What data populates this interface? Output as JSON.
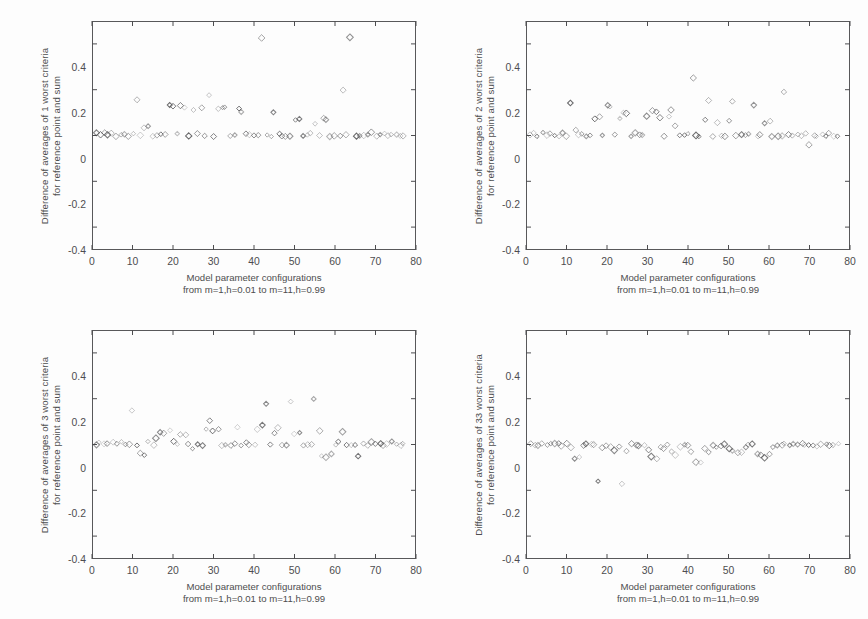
{
  "figure": {
    "panel_count": 4,
    "background_color": "#fdfdfd",
    "ink_color": "#4d4d4f",
    "marker_symbol": "open-diamond"
  },
  "axis": {
    "x_ticks": [
      "0",
      "10",
      "20",
      "30",
      "40",
      "50",
      "60",
      "70",
      "80"
    ],
    "y_ticks": [
      "0.4",
      "0.2",
      "0",
      "-0.2",
      "-0.4"
    ],
    "xlabel_line1": "Model parameter configurations",
    "xlabel_line2": "from m=1,h=0.01 to m=11,h=0.99",
    "xlabel": "Model parameter configurations\nfrom m=1,h=0.01 to m=11,h=0.99"
  },
  "panels": [
    {
      "id": "panel-1-worst",
      "ylabel_line1": "Difference of averages of 1 worst criteria",
      "ylabel_line2": "for reference point and sum",
      "ylabel": "Difference of averages of 1 worst criteria\nfor reference point and sum"
    },
    {
      "id": "panel-2-worst",
      "ylabel_line1": "Difference of averages of 2 worst criteria",
      "ylabel_line2": "for reference point and sum",
      "ylabel": "Difference of averages of 2 worst criteria\nfor reference point and sum"
    },
    {
      "id": "panel-3-worst",
      "ylabel_line1": "Difference of averages of 3 worst criteria",
      "ylabel_line2": "for reference point and sum",
      "ylabel": "Difference of averages of 3 worst criteria\nfor reference point and sum"
    },
    {
      "id": "panel-33-worst",
      "ylabel_line1": "Difference of averages of 33 worst criteria",
      "ylabel_line2": "for reference point and sum",
      "ylabel": "Difference of averages of 33 worst criteria\nfor reference point and sum"
    }
  ],
  "chart_data": [
    {
      "type": "scatter",
      "title": "",
      "xlabel": "Model parameter configurations from m=1,h=0.01 to m=11,h=0.99",
      "ylabel": "Difference of averages of 1 worst criteria for reference point and sum",
      "xlim": [
        0,
        80
      ],
      "ylim": [
        -0.5,
        0.5
      ],
      "xticks": [
        0,
        10,
        20,
        30,
        40,
        50,
        60,
        70,
        80
      ],
      "yticks": [
        -0.4,
        -0.2,
        0,
        0.2,
        0.4
      ],
      "grid": false,
      "legend": "none",
      "marker": "open-diamond",
      "series": [
        {
          "name": "1 worst criteria",
          "x": [
            1,
            2,
            3,
            4,
            5,
            6,
            7,
            8,
            9,
            10,
            11,
            12,
            13,
            14,
            15,
            16,
            17,
            18,
            19,
            20,
            21,
            22,
            23,
            24,
            25,
            26,
            27,
            28,
            29,
            30,
            31,
            32,
            33,
            34,
            35,
            36,
            37,
            38,
            39,
            40,
            41,
            42,
            43,
            44,
            45,
            46,
            47,
            48,
            49,
            50,
            51,
            52,
            53,
            54,
            55,
            56,
            57,
            58,
            59,
            60,
            61,
            62,
            63,
            64,
            65,
            66,
            67,
            68,
            69,
            70,
            71,
            72,
            73,
            74,
            75,
            76,
            77
          ],
          "y": [
            0.01,
            0.0,
            0.01,
            0.0,
            0.01,
            0.0,
            0.0,
            0.01,
            0.0,
            0.01,
            0.155,
            0.0,
            0.03,
            0.04,
            0.0,
            0.0,
            0.01,
            0.0,
            0.135,
            0.125,
            0.01,
            0.13,
            0.125,
            0.0,
            0.115,
            0.01,
            0.125,
            0.0,
            0.175,
            0.0,
            0.115,
            0.12,
            0.12,
            0.0,
            0.0,
            0.115,
            0.105,
            0.01,
            0.0,
            0.0,
            0.0,
            0.43,
            0.0,
            0.0,
            0.105,
            0.01,
            0.0,
            0.0,
            0.0,
            0.065,
            0.07,
            0.0,
            0.0,
            0.01,
            0.055,
            0.0,
            0.075,
            0.07,
            0.0,
            0.0,
            0.0,
            0.2,
            0.0,
            0.425,
            0.0,
            0.0,
            0.0,
            0.0,
            0.01,
            0.0,
            0.0,
            0.01,
            0.0,
            0.0,
            0.0,
            0.0,
            0.0
          ]
        }
      ]
    },
    {
      "type": "scatter",
      "title": "",
      "xlabel": "Model parameter configurations from m=1,h=0.01 to m=11,h=0.99",
      "ylabel": "Difference of averages of 2 worst criteria for reference point and sum",
      "xlim": [
        0,
        80
      ],
      "ylim": [
        -0.5,
        0.5
      ],
      "xticks": [
        0,
        10,
        20,
        30,
        40,
        50,
        60,
        70,
        80
      ],
      "yticks": [
        -0.4,
        -0.2,
        0,
        0.2,
        0.4
      ],
      "grid": false,
      "legend": "none",
      "marker": "open-diamond",
      "series": [
        {
          "name": "2 worst criteria",
          "x": [
            1,
            2,
            3,
            4,
            5,
            6,
            7,
            8,
            9,
            10,
            11,
            12,
            13,
            14,
            15,
            16,
            17,
            18,
            19,
            20,
            21,
            22,
            23,
            24,
            25,
            26,
            27,
            28,
            29,
            30,
            31,
            32,
            33,
            34,
            35,
            36,
            37,
            38,
            39,
            40,
            41,
            42,
            43,
            44,
            45,
            46,
            47,
            48,
            49,
            50,
            51,
            52,
            53,
            54,
            55,
            56,
            57,
            58,
            59,
            60,
            61,
            62,
            63,
            64,
            65,
            66,
            67,
            68,
            69,
            70,
            71,
            72,
            73,
            74,
            75,
            76,
            77
          ],
          "y": [
            0.0,
            0.01,
            0.0,
            0.01,
            0.0,
            0.01,
            0.0,
            0.0,
            0.01,
            0.0,
            0.145,
            0.02,
            0.0,
            0.01,
            0.0,
            0.0,
            0.075,
            0.08,
            0.0,
            0.135,
            0.13,
            0.0,
            0.075,
            0.095,
            0.095,
            0.0,
            0.01,
            0.0,
            0.0,
            0.085,
            0.105,
            0.1,
            0.075,
            0.0,
            0.085,
            0.11,
            0.04,
            0.0,
            0.0,
            0.01,
            0.255,
            0.0,
            0.0,
            0.07,
            0.155,
            0.0,
            0.06,
            0.0,
            0.0,
            0.06,
            0.145,
            0.0,
            0.0,
            0.0,
            0.01,
            0.135,
            0.0,
            0.0,
            0.055,
            0.06,
            0.0,
            0.0,
            0.0,
            0.19,
            0.0,
            0.0,
            0.0,
            0.0,
            0.01,
            -0.04,
            0.0,
            0.0,
            0.0,
            0.0,
            0.01,
            0.0,
            0.0
          ]
        }
      ]
    },
    {
      "type": "scatter",
      "title": "",
      "xlabel": "Model parameter configurations from m=1,h=0.01 to m=11,h=0.99",
      "ylabel": "Difference of averages of 3 worst criteria for reference point and sum",
      "xlim": [
        0,
        80
      ],
      "ylim": [
        -0.5,
        0.5
      ],
      "xticks": [
        0,
        10,
        20,
        30,
        40,
        50,
        60,
        70,
        80
      ],
      "yticks": [
        -0.4,
        -0.2,
        0,
        0.2,
        0.4
      ],
      "grid": false,
      "legend": "none",
      "marker": "open-diamond",
      "series": [
        {
          "name": "3 worst criteria",
          "x": [
            1,
            2,
            3,
            4,
            5,
            6,
            7,
            8,
            9,
            10,
            11,
            12,
            13,
            14,
            15,
            16,
            17,
            18,
            19,
            20,
            21,
            22,
            23,
            24,
            25,
            26,
            27,
            28,
            29,
            30,
            31,
            32,
            33,
            34,
            35,
            36,
            37,
            38,
            39,
            40,
            41,
            42,
            43,
            44,
            45,
            46,
            47,
            48,
            49,
            50,
            51,
            52,
            53,
            54,
            55,
            56,
            57,
            58,
            59,
            60,
            61,
            62,
            63,
            64,
            65,
            66,
            67,
            68,
            69,
            70,
            71,
            72,
            73,
            74,
            75,
            76,
            77
          ],
          "y": [
            0.0,
            0.01,
            0.0,
            0.0,
            0.01,
            0.0,
            0.01,
            0.0,
            0.0,
            0.145,
            0.0,
            -0.04,
            -0.045,
            0.01,
            0.0,
            0.03,
            0.055,
            0.05,
            0.06,
            0.01,
            0.0,
            0.04,
            0.04,
            0.0,
            -0.015,
            0.0,
            0.0,
            0.07,
            0.1,
            0.06,
            0.065,
            0.0,
            0.0,
            0.0,
            0.0,
            0.075,
            0.0,
            0.01,
            0.0,
            0.0,
            0.065,
            0.08,
            0.175,
            0.0,
            0.05,
            0.07,
            0.0,
            0.0,
            0.19,
            0.05,
            0.05,
            0.0,
            0.0,
            0.0,
            0.195,
            0.055,
            -0.05,
            -0.055,
            -0.045,
            0.0,
            0.01,
            0.06,
            0.0,
            0.0,
            0.0,
            -0.05,
            0.0,
            0.0,
            0.01,
            0.0,
            0.0,
            0.0,
            0.0,
            0.01,
            0.0,
            0.0,
            0.0
          ]
        }
      ]
    },
    {
      "type": "scatter",
      "title": "",
      "xlabel": "Model parameter configurations from m=1,h=0.01 to m=11,h=0.99",
      "ylabel": "Difference of averages of 33 worst criteria for reference point and sum",
      "xlim": [
        0,
        80
      ],
      "ylim": [
        -0.5,
        0.5
      ],
      "xticks": [
        0,
        10,
        20,
        30,
        40,
        50,
        60,
        70,
        80
      ],
      "yticks": [
        -0.4,
        -0.2,
        0,
        0.2,
        0.4
      ],
      "grid": false,
      "legend": "none",
      "marker": "open-diamond",
      "series": [
        {
          "name": "33 worst criteria",
          "x": [
            1,
            2,
            3,
            4,
            5,
            6,
            7,
            8,
            9,
            10,
            11,
            12,
            13,
            14,
            15,
            16,
            17,
            18,
            19,
            20,
            21,
            22,
            23,
            24,
            25,
            26,
            27,
            28,
            29,
            30,
            31,
            32,
            33,
            34,
            35,
            36,
            37,
            38,
            39,
            40,
            41,
            42,
            43,
            44,
            45,
            46,
            47,
            48,
            49,
            50,
            51,
            52,
            53,
            54,
            55,
            56,
            57,
            58,
            59,
            60,
            61,
            62,
            63,
            64,
            65,
            66,
            67,
            68,
            69,
            70,
            71,
            72,
            73,
            74,
            75,
            76,
            77
          ],
          "y": [
            0.0,
            0.0,
            0.0,
            0.0,
            -0.005,
            0.0,
            0.0,
            0.0,
            -0.005,
            0.0,
            -0.01,
            -0.06,
            -0.055,
            0.0,
            0.0,
            0.0,
            -0.005,
            -0.165,
            -0.01,
            -0.01,
            -0.015,
            -0.03,
            -0.01,
            -0.175,
            -0.03,
            0.0,
            -0.005,
            -0.01,
            0.0,
            -0.02,
            -0.055,
            -0.06,
            -0.015,
            -0.02,
            0.0,
            -0.03,
            -0.045,
            -0.01,
            -0.005,
            0.0,
            -0.035,
            -0.08,
            -0.075,
            -0.02,
            -0.03,
            0.0,
            -0.01,
            -0.005,
            0.0,
            -0.02,
            -0.03,
            -0.035,
            -0.035,
            -0.01,
            -0.005,
            0.0,
            -0.045,
            -0.05,
            -0.055,
            -0.04,
            -0.01,
            -0.005,
            0.0,
            0.0,
            -0.005,
            0.0,
            0.0,
            0.0,
            0.0,
            0.0,
            0.0,
            -0.005,
            0.0,
            0.0,
            0.0,
            0.0,
            0.0
          ]
        }
      ]
    }
  ]
}
